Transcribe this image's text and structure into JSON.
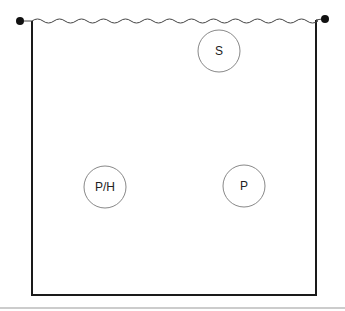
{
  "diagram": {
    "type": "enclosure-with-nodes",
    "colors": {
      "line": "#1a1a1a",
      "wave": "#444444",
      "circle_stroke": "#888888",
      "rule": "#bbbbbb",
      "background": "#ffffff"
    },
    "top_edge": {
      "style": "wavy",
      "endpoints": "filled-dots"
    },
    "nodes": [
      {
        "id": "s",
        "label": "S",
        "cx": 219,
        "cy": 51,
        "r": 21
      },
      {
        "id": "ph",
        "label": "P/H",
        "cx": 105,
        "cy": 187,
        "r": 21
      },
      {
        "id": "p",
        "label": "P",
        "cx": 244,
        "cy": 186,
        "r": 21
      }
    ]
  }
}
